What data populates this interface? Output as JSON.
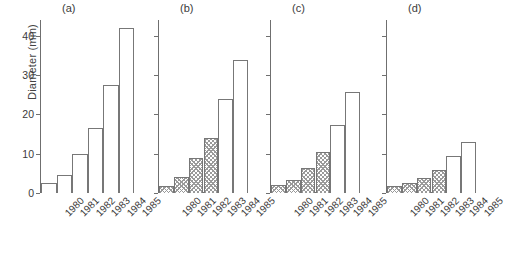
{
  "figure": {
    "ylabel": "Diameter (mm)",
    "ytick_labels": [
      "0",
      "10",
      "20",
      "30",
      "40"
    ],
    "ytick_values": [
      0,
      10,
      20,
      30,
      40
    ],
    "ylim": [
      0,
      44
    ],
    "categories": [
      "1980",
      "1981",
      "1982",
      "1983",
      "1984",
      "1985"
    ],
    "panel_titles": [
      "(a)",
      "(b)",
      "(c)",
      "(d)"
    ],
    "colors": {
      "axis": "#6f6f6f",
      "bar_edge": "#777777",
      "bar_open_fill": "#ffffff",
      "bar_hatch_line": "#9a9a9a",
      "text": "#3a3a3a"
    }
  },
  "chart_data": {
    "type": "bar",
    "title": "",
    "xlabel": "",
    "ylabel": "Diameter (mm)",
    "ylim": [
      0,
      44
    ],
    "grid": false,
    "legend": "none",
    "categories": [
      "1980",
      "1981",
      "1982",
      "1983",
      "1984",
      "1985"
    ],
    "panels": [
      {
        "label": "(a)",
        "values": [
          2.5,
          4.5,
          9.8,
          16.5,
          27.5,
          42.0
        ],
        "fills": [
          "open",
          "open",
          "open",
          "open",
          "open",
          "open"
        ]
      },
      {
        "label": "(b)",
        "values": [
          1.8,
          4.2,
          8.8,
          14.0,
          24.0,
          33.8
        ],
        "fills": [
          "hatched",
          "hatched",
          "hatched",
          "hatched",
          "open",
          "open"
        ]
      },
      {
        "label": "(c)",
        "values": [
          2.0,
          3.3,
          6.3,
          10.5,
          17.2,
          25.8
        ],
        "fills": [
          "hatched",
          "hatched",
          "hatched",
          "hatched",
          "open",
          "open"
        ]
      },
      {
        "label": "(d)",
        "values": [
          1.8,
          2.5,
          3.8,
          5.8,
          9.5,
          13.0
        ],
        "fills": [
          "hatched",
          "hatched",
          "hatched",
          "hatched",
          "open",
          "open"
        ]
      }
    ]
  }
}
